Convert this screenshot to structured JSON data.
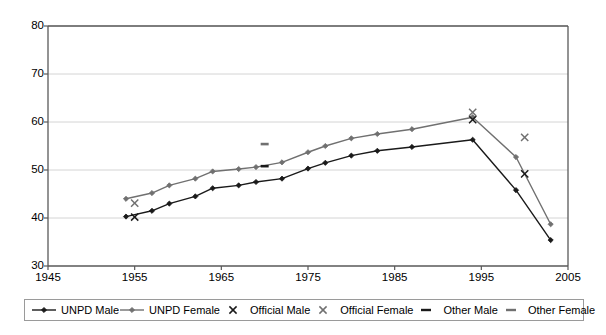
{
  "chart_data": {
    "type": "line",
    "title": "",
    "xlabel": "",
    "ylabel": "",
    "xlim": [
      1945,
      2005
    ],
    "ylim": [
      30,
      80
    ],
    "xticks": [
      1945,
      1955,
      1965,
      1975,
      1985,
      1995,
      2005
    ],
    "yticks": [
      30,
      40,
      50,
      60,
      70,
      80
    ],
    "grid": "horizontal",
    "legend_position": "bottom",
    "series": [
      {
        "name": "UNPD Male",
        "type": "line",
        "marker": "diamond",
        "color": "#1a1a1a",
        "points": [
          {
            "x": 1954,
            "y": 40.3
          },
          {
            "x": 1957,
            "y": 41.5
          },
          {
            "x": 1959,
            "y": 43.0
          },
          {
            "x": 1962,
            "y": 44.5
          },
          {
            "x": 1964,
            "y": 46.2
          },
          {
            "x": 1967,
            "y": 46.8
          },
          {
            "x": 1969,
            "y": 47.5
          },
          {
            "x": 1972,
            "y": 48.2
          },
          {
            "x": 1975,
            "y": 50.3
          },
          {
            "x": 1977,
            "y": 51.5
          },
          {
            "x": 1980,
            "y": 53.0
          },
          {
            "x": 1983,
            "y": 54.0
          },
          {
            "x": 1987,
            "y": 54.8
          },
          {
            "x": 1994,
            "y": 56.3
          },
          {
            "x": 1999,
            "y": 45.8
          },
          {
            "x": 2003,
            "y": 35.4
          }
        ]
      },
      {
        "name": "UNPD Female",
        "type": "line",
        "marker": "diamond",
        "color": "#707070",
        "points": [
          {
            "x": 1954,
            "y": 44.0
          },
          {
            "x": 1957,
            "y": 45.2
          },
          {
            "x": 1959,
            "y": 46.8
          },
          {
            "x": 1962,
            "y": 48.2
          },
          {
            "x": 1964,
            "y": 49.7
          },
          {
            "x": 1967,
            "y": 50.2
          },
          {
            "x": 1969,
            "y": 50.6
          },
          {
            "x": 1972,
            "y": 51.6
          },
          {
            "x": 1975,
            "y": 53.7
          },
          {
            "x": 1977,
            "y": 55.0
          },
          {
            "x": 1980,
            "y": 56.6
          },
          {
            "x": 1983,
            "y": 57.5
          },
          {
            "x": 1987,
            "y": 58.5
          },
          {
            "x": 1994,
            "y": 61.0
          },
          {
            "x": 1999,
            "y": 52.7
          },
          {
            "x": 2003,
            "y": 38.7
          }
        ]
      },
      {
        "name": "Official Male",
        "type": "scatter",
        "marker": "x",
        "color": "#1a1a1a",
        "points": [
          {
            "x": 1955,
            "y": 40.2
          },
          {
            "x": 1994,
            "y": 60.5
          },
          {
            "x": 2000,
            "y": 49.2
          }
        ]
      },
      {
        "name": "Official Female",
        "type": "scatter",
        "marker": "x",
        "color": "#707070",
        "points": [
          {
            "x": 1955,
            "y": 43.1
          },
          {
            "x": 1994,
            "y": 62.0
          },
          {
            "x": 2000,
            "y": 56.8
          }
        ]
      },
      {
        "name": "Other Male",
        "type": "scatter",
        "marker": "dash",
        "color": "#1a1a1a",
        "points": [
          {
            "x": 1970,
            "y": 50.8
          }
        ]
      },
      {
        "name": "Other Female",
        "type": "scatter",
        "marker": "dash",
        "color": "#707070",
        "points": [
          {
            "x": 1970,
            "y": 55.4
          }
        ]
      }
    ]
  },
  "legend": {
    "entries": [
      {
        "label": "UNPD Male",
        "key": "line-diamond",
        "color": "#1a1a1a"
      },
      {
        "label": "UNPD Female",
        "key": "line-diamond",
        "color": "#707070"
      },
      {
        "label": "Official Male",
        "key": "x-marker",
        "color": "#1a1a1a"
      },
      {
        "label": "Official Female",
        "key": "x-marker",
        "color": "#707070"
      },
      {
        "label": "Other Male",
        "key": "dash-marker",
        "color": "#1a1a1a"
      },
      {
        "label": "Other Female",
        "key": "dash-marker",
        "color": "#707070"
      }
    ]
  },
  "axes": {
    "y_labels": [
      "80",
      "70",
      "60",
      "50",
      "40",
      "30"
    ],
    "x_labels": [
      "1945",
      "1955",
      "1965",
      "1975",
      "1985",
      "1995",
      "2005"
    ]
  },
  "colors": {
    "axis": "#595959",
    "grid": "#d4d4d4",
    "male": "#1a1a1a",
    "female": "#707070",
    "background": "#ffffff"
  }
}
